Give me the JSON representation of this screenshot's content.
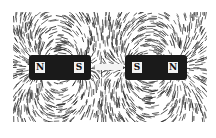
{
  "figure": {
    "magnets": [
      {
        "left_pole": "N",
        "right_pole": "S"
      },
      {
        "left_pole": "S",
        "right_pole": "N"
      }
    ]
  }
}
